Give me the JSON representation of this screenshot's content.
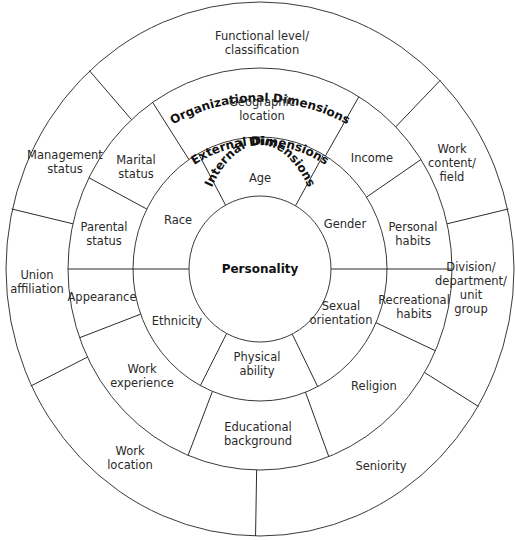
{
  "diagram": {
    "center": {
      "x": 260,
      "y": 269
    },
    "colors": {
      "organizational": "#9c9c9c",
      "external": "#cdcdcd",
      "internal": "#a4a4a4",
      "core": "#c8c8c8",
      "lines": "#2b2b2b",
      "text": "#2a2a2a"
    },
    "core": {
      "label": "Personality",
      "radius": 71
    },
    "rings": [
      {
        "id": "internal",
        "title": "Internal Dimensions",
        "inner_radius": 71,
        "outer_radius": 127,
        "dividers_deg": [
          -29,
          30,
          90,
          153,
          208,
          270
        ],
        "segments": [
          {
            "label": "Age",
            "lines": [
              "Age"
            ],
            "x": 260,
            "y": 178
          },
          {
            "label": "Gender",
            "lines": [
              "Gender"
            ],
            "x": 345,
            "y": 224
          },
          {
            "label": "Sexual orientation",
            "lines": [
              "Sexual",
              "orientation"
            ],
            "x": 341,
            "y": 313
          },
          {
            "label": "Physical ability",
            "lines": [
              "Physical",
              "ability"
            ],
            "x": 257,
            "y": 364
          },
          {
            "label": "Ethnicity",
            "lines": [
              "Ethnicity"
            ],
            "x": 177,
            "y": 321
          },
          {
            "label": "Race",
            "lines": [
              "Race"
            ],
            "x": 178,
            "y": 220
          }
        ]
      },
      {
        "id": "external",
        "title": "External Dimensions",
        "inner_radius": 127,
        "outer_radius": 192,
        "dividers_deg": [
          -34,
          31,
          57,
          90,
          114,
          159,
          202,
          250,
          270,
          297
        ],
        "segments": [
          {
            "label": "Geographic location",
            "lines": [
              "Geographic",
              "location"
            ],
            "x": 262,
            "y": 109
          },
          {
            "label": "Income",
            "lines": [
              "Income"
            ],
            "x": 372,
            "y": 158
          },
          {
            "label": "Personal habits",
            "lines": [
              "Personal",
              "habits"
            ],
            "x": 413,
            "y": 234
          },
          {
            "label": "Recreational habits",
            "lines": [
              "Recreational",
              "habits"
            ],
            "x": 414,
            "y": 307
          },
          {
            "label": "Religion",
            "lines": [
              "Religion"
            ],
            "x": 374,
            "y": 386
          },
          {
            "label": "Educational background",
            "lines": [
              "Educational",
              "background"
            ],
            "x": 258,
            "y": 434
          },
          {
            "label": "Work experience",
            "lines": [
              "Work",
              "experience"
            ],
            "x": 142,
            "y": 376
          },
          {
            "label": "Appearance",
            "lines": [
              "Appearance"
            ],
            "x": 102,
            "y": 297
          },
          {
            "label": "Parental status",
            "lines": [
              "Parental",
              "status"
            ],
            "x": 104,
            "y": 234
          },
          {
            "label": "Marital status",
            "lines": [
              "Marital",
              "status"
            ],
            "x": 136,
            "y": 167
          }
        ]
      },
      {
        "id": "organizational",
        "title": "Organizational Dimensions",
        "inner_radius": 192,
        "outer_radius": 255,
        "dividers_deg": [
          -42,
          45,
          77,
          121,
          181,
          244,
          283
        ],
        "segments": [
          {
            "label": "Functional level/classification",
            "lines": [
              "Functional level/",
              "classification"
            ],
            "x": 262,
            "y": 43
          },
          {
            "label": "Work content/field",
            "lines": [
              "Work",
              "content/",
              "field"
            ],
            "x": 452,
            "y": 163
          },
          {
            "label": "Division/department/unit group",
            "lines": [
              "Division/",
              "department/",
              "unit",
              "group"
            ],
            "x": 471,
            "y": 288
          },
          {
            "label": "Seniority",
            "lines": [
              "Seniority"
            ],
            "x": 381,
            "y": 466
          },
          {
            "label": "Work location",
            "lines": [
              "Work",
              "location"
            ],
            "x": 130,
            "y": 458
          },
          {
            "label": "Union affiliation",
            "lines": [
              "Union",
              "affiliation"
            ],
            "x": 37,
            "y": 282
          },
          {
            "label": "Management status",
            "lines": [
              "Management",
              "status"
            ],
            "x": 65,
            "y": 162
          }
        ]
      }
    ]
  }
}
